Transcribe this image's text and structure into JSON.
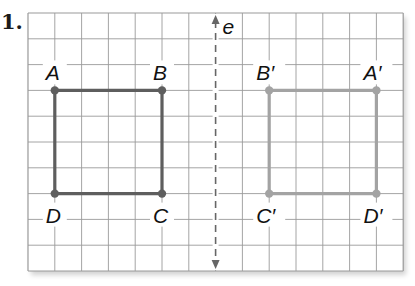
{
  "problem_number": "1.",
  "grid": {
    "columns": 14,
    "rows": 10,
    "cell_width": 26.8,
    "cell_height": 25.8,
    "left": 28,
    "top": 13,
    "line_color": "#9a9a9a"
  },
  "reflection_line": {
    "label": "e",
    "column": 7,
    "style": "dashed",
    "color": "#666666"
  },
  "original_figure": {
    "color": "#5e5e5e",
    "vertices": [
      {
        "label": "A",
        "col": 1,
        "row": 3
      },
      {
        "label": "B",
        "col": 5,
        "row": 3
      },
      {
        "label": "C",
        "col": 5,
        "row": 7
      },
      {
        "label": "D",
        "col": 1,
        "row": 7
      }
    ]
  },
  "image_figure": {
    "color": "#a3a3a3",
    "vertices": [
      {
        "label": "A′",
        "col": 13,
        "row": 3
      },
      {
        "label": "B′",
        "col": 9,
        "row": 3
      },
      {
        "label": "C′",
        "col": 9,
        "row": 7
      },
      {
        "label": "D′",
        "col": 13,
        "row": 7
      }
    ]
  }
}
